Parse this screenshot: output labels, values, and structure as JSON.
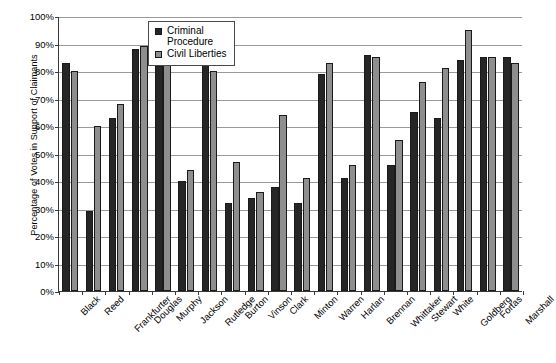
{
  "chart_data": {
    "type": "bar",
    "title": "",
    "xlabel": "",
    "ylabel": "Percentage of Votes in Support of Claimants",
    "ylim": [
      0,
      100
    ],
    "y_tick_labels": [
      "100%",
      "90%",
      "80%",
      "70%",
      "60%",
      "50%",
      "40%",
      "30%",
      "20%",
      "10%",
      "0%"
    ],
    "y_tick_values": [
      100,
      90,
      80,
      70,
      60,
      50,
      40,
      30,
      20,
      10,
      0
    ],
    "grid": true,
    "legend_position": "top-center",
    "categories": [
      "Black",
      "Reed",
      "Frankfurter",
      "Douglas",
      "Murphy",
      "Jackson",
      "Rutledge",
      "Burton",
      "Vinson",
      "Clark",
      "Minton",
      "Warren",
      "Harlan",
      "Brennan",
      "Whittaker",
      "Stewart",
      "White",
      "Goldberg",
      "Fortas",
      "Marshall"
    ],
    "series": [
      {
        "name": "Criminal Procedure",
        "color": "#262626",
        "values": [
          83,
          29,
          63,
          88,
          82,
          40,
          86,
          32,
          34,
          38,
          32,
          79,
          41,
          86,
          46,
          65,
          63,
          84,
          85,
          85
        ]
      },
      {
        "name": "Civil Liberties",
        "color": "#8e8e8e",
        "values": [
          80,
          60,
          68,
          89,
          85,
          44,
          80,
          47,
          36,
          64,
          41,
          83,
          46,
          85,
          55,
          76,
          81,
          95,
          85,
          83
        ]
      }
    ]
  },
  "legend": {
    "items": [
      {
        "label": "Criminal\nProcedure",
        "swatch": "criminal"
      },
      {
        "label": "Civil Liberties",
        "swatch": "civil"
      }
    ]
  }
}
